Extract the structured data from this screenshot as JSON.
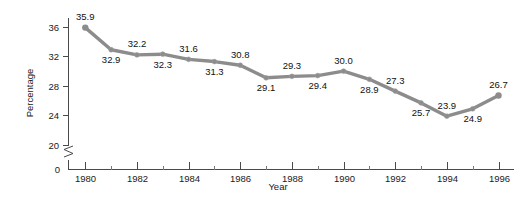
{
  "chart_data": {
    "type": "line",
    "title": "",
    "xlabel": "Year",
    "ylabel": "Percentage",
    "x": [
      1980,
      1981,
      1982,
      1983,
      1984,
      1985,
      1986,
      1987,
      1988,
      1989,
      1990,
      1991,
      1992,
      1993,
      1994,
      1995,
      1996
    ],
    "values": [
      35.9,
      32.9,
      32.2,
      32.3,
      31.6,
      31.3,
      30.8,
      29.1,
      29.3,
      29.4,
      30.0,
      28.9,
      27.3,
      25.7,
      23.9,
      24.9,
      26.7
    ],
    "point_labels": [
      "35.9",
      "32.9",
      "32.2",
      "32.3",
      "31.6",
      "31.3",
      "30.8",
      "29.1",
      "29.3",
      "29.4",
      "30.0",
      "28.9",
      "27.3",
      "25.7",
      "23.9",
      "24.9",
      "26.7"
    ],
    "label_positions": [
      "above",
      "below",
      "above",
      "below",
      "above",
      "below",
      "above",
      "below",
      "above",
      "below",
      "above",
      "below",
      "above",
      "below",
      "above",
      "below",
      "above"
    ],
    "xlim": [
      1979.35,
      1996.6
    ],
    "ylim": [
      20,
      37.2
    ],
    "y_ticks": [
      "36",
      "32",
      "28",
      "24",
      "20"
    ],
    "y_tick_values": [
      36,
      32,
      28,
      24,
      20
    ],
    "y_zero_label": "0",
    "x_ticks": [
      "1980",
      "1982",
      "1984",
      "1986",
      "1988",
      "1990",
      "1992",
      "1994",
      "1996"
    ],
    "x_tick_values": [
      1980,
      1982,
      1984,
      1986,
      1988,
      1990,
      1992,
      1994,
      1996
    ],
    "x_minor_values": [
      1981,
      1983,
      1985,
      1987,
      1989,
      1991,
      1993,
      1995
    ],
    "axis_break": true,
    "grid": false,
    "legend": "none",
    "series_color": "#8c8c8c",
    "axis_color": "#4a4a4a",
    "text_color": "#111111"
  }
}
